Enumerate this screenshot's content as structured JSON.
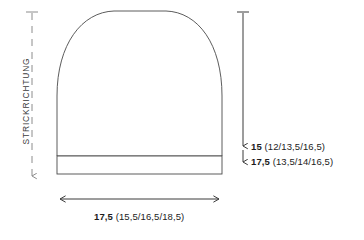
{
  "diagram": {
    "type": "knitting-schematic",
    "garment": "beanie-hat",
    "knit_direction_label": "STRICKRICHTUNG",
    "colors": {
      "outline": "#4a4a4a",
      "dimension_line": "#3a3a3a",
      "direction_line": "#8c8c8c",
      "text": "#1c1c1c",
      "direction_text": "#3d3d3d",
      "background": "#ffffff"
    },
    "dimensions": {
      "height_crown": {
        "primary": "15",
        "variants": "(12/13,5/16,5)"
      },
      "height_total": {
        "primary": "17,5",
        "variants": "(13,5/14/16,5)"
      },
      "width_bottom": {
        "primary": "17,5",
        "variants": "(15,5/16,5/18,5)"
      }
    }
  }
}
